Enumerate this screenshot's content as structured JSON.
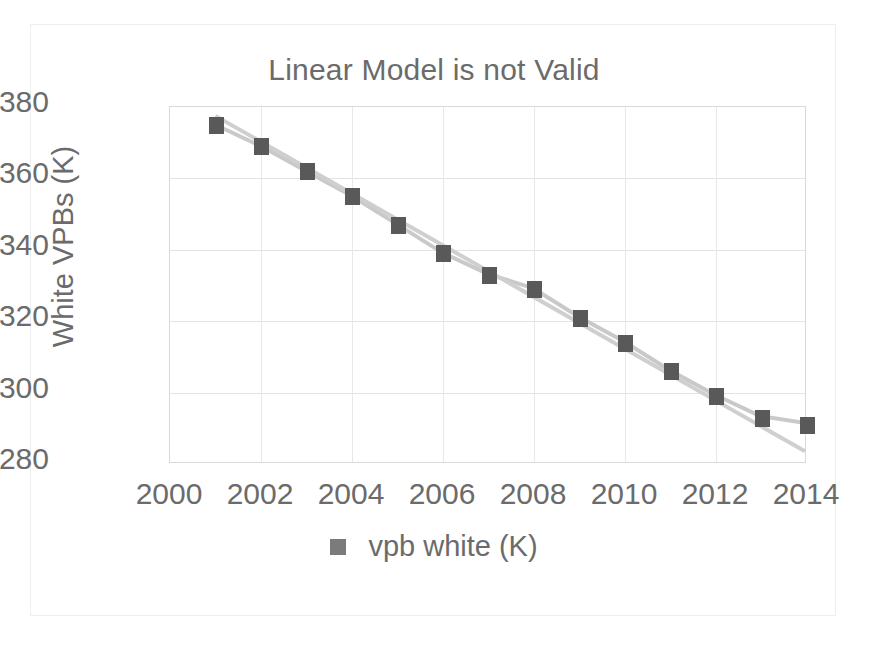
{
  "chart": {
    "title": "Linear Model is not Valid",
    "y_axis_title": "White VPBs (K)",
    "x_axis_title": "",
    "legend": {
      "label": "vpb white (K)",
      "marker_color": "#7b7b7b",
      "position": "bottom"
    },
    "colors": {
      "marker": "#595959",
      "series_line": "#c9c9c9",
      "trendline": "#cfcfcf",
      "gridline": "#e3e3e3",
      "plot_border": "#d9d9d9",
      "text": "#6b6b6b",
      "background": "#ffffff"
    }
  },
  "chart_data": {
    "type": "scatter",
    "title": "Linear Model is not Valid",
    "xlabel": "",
    "ylabel": "White VPBs (K)",
    "xlim": [
      2000,
      2014
    ],
    "ylim": [
      280,
      380
    ],
    "xticks": [
      2000,
      2002,
      2004,
      2006,
      2008,
      2010,
      2012,
      2014
    ],
    "yticks": [
      280,
      300,
      320,
      340,
      360,
      380
    ],
    "grid": true,
    "legend_position": "bottom",
    "series": [
      {
        "name": "vpb white (K)",
        "marker": "square",
        "color": "#595959",
        "x": [
          2001,
          2002,
          2003,
          2004,
          2005,
          2006,
          2007,
          2008,
          2009,
          2010,
          2011,
          2012,
          2013,
          2014
        ],
        "values": [
          375,
          369,
          362,
          355,
          347,
          339,
          333,
          329,
          321,
          314,
          306,
          299,
          293,
          291
        ]
      }
    ],
    "trendline": {
      "name": "linear fit",
      "color": "#cfcfcf",
      "x": [
        2001,
        2014
      ],
      "values": [
        377.5,
        283.0
      ]
    },
    "annotations": []
  },
  "footer": {
    "caption": ""
  }
}
